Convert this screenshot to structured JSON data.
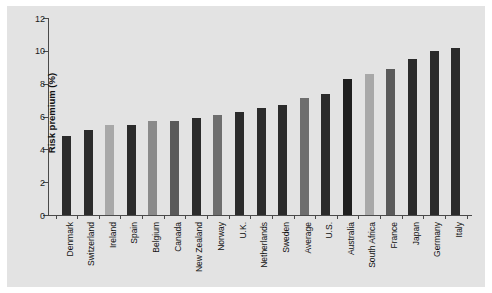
{
  "chart_data": {
    "type": "bar",
    "title": "",
    "xlabel": "",
    "ylabel": "Risk premium (%)",
    "ylim": [
      0,
      12
    ],
    "yticks": [
      0,
      2,
      4,
      6,
      8,
      10,
      12
    ],
    "grid": false,
    "legend": "none",
    "categories": [
      "Denmark",
      "Switzerland",
      "Ireland",
      "Spain",
      "Belgium",
      "Canada",
      "New Zealand",
      "Norway",
      "U.K.",
      "Netherlands",
      "Sweden",
      "Average",
      "U.S.",
      "Australia",
      "South Africa",
      "France",
      "Japan",
      "Germany",
      "Italy"
    ],
    "values": [
      4.8,
      5.2,
      5.5,
      5.5,
      5.7,
      5.7,
      5.9,
      6.1,
      6.3,
      6.5,
      6.7,
      7.1,
      7.4,
      8.3,
      8.6,
      8.9,
      9.5,
      10.0,
      10.2
    ],
    "bar_colors": [
      "#2b2b2b",
      "#2b2b2b",
      "#a8a8a8",
      "#2b2b2b",
      "#8a8a8a",
      "#5a5a5a",
      "#2b2b2b",
      "#6e6e6e",
      "#2b2b2b",
      "#2b2b2b",
      "#2b2b2b",
      "#6e6e6e",
      "#2b2b2b",
      "#1f1f1f",
      "#a8a8a8",
      "#5a5a5a",
      "#2b2b2b",
      "#2b2b2b",
      "#2b2b2b"
    ],
    "panel_color": "#e3e3e3",
    "axis_color": "#4a4a4a",
    "text_color": "#111111"
  }
}
